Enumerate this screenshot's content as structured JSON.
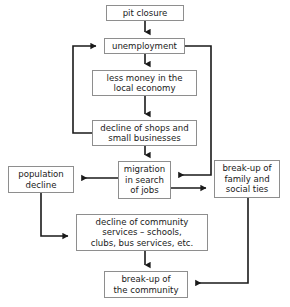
{
  "diagram": {
    "type": "flowchart",
    "style": {
      "box_border_color": "#8e8e8e",
      "connector_color": "#1a1a1a",
      "background_color": "#ffffff",
      "text_color": "#1a1a1a"
    },
    "nodes": [
      {
        "id": "pit-closure",
        "label": "pit closure"
      },
      {
        "id": "unemployment",
        "label": "unemployment"
      },
      {
        "id": "less-money",
        "label": "less money in the\nlocal economy"
      },
      {
        "id": "decline-shops",
        "label": "decline of shops and\nsmall businesses"
      },
      {
        "id": "migration",
        "label": "migration\nin search\nof jobs"
      },
      {
        "id": "population-decline",
        "label": "population\ndecline"
      },
      {
        "id": "breakup-family",
        "label": "break-up of\nfamily and\nsocial ties"
      },
      {
        "id": "community-services",
        "label": "decline of community\nservices – schools,\nclubs, bus services, etc."
      },
      {
        "id": "breakup-community",
        "label": "break-up of\nthe community"
      }
    ],
    "edges": [
      {
        "from": "pit-closure",
        "to": "unemployment",
        "kind": "straight-down"
      },
      {
        "from": "unemployment",
        "to": "less-money",
        "kind": "straight-down"
      },
      {
        "from": "less-money",
        "to": "decline-shops",
        "kind": "straight-down"
      },
      {
        "from": "decline-shops",
        "to": "migration",
        "kind": "straight-down"
      },
      {
        "from": "decline-shops",
        "to": "unemployment",
        "kind": "feedback-loop-left"
      },
      {
        "from": "unemployment",
        "to": "migration",
        "kind": "feedback-loop-right"
      },
      {
        "from": "migration",
        "to": "population-decline",
        "kind": "straight-left"
      },
      {
        "from": "migration",
        "to": "breakup-family",
        "kind": "straight-right"
      },
      {
        "from": "population-decline",
        "to": "community-services",
        "kind": "elbow-down-right"
      },
      {
        "from": "community-services",
        "to": "breakup-community",
        "kind": "straight-down"
      },
      {
        "from": "breakup-family",
        "to": "breakup-community",
        "kind": "elbow-down-left"
      }
    ]
  }
}
